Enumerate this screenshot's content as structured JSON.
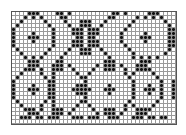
{
  "pattern": {
    "type": "chart-grid",
    "columns": 41,
    "rows": 28,
    "symbol_color": "#111111",
    "grid_color": "#9a9a9a",
    "rows_data": [
      "....XXX....XX.X..........XX.X.....XXX....",
      "...X.X.X....XX..........XX.....X.X.X.X...",
      "..X.....X....X...XXX...X......X.......X..",
      ".X.......X....X..XXX..X......X.........X.",
      "X.........X....XXX.XXX......X..........XX",
      "X....X....X....XXX.XXX.....X.....X.....XX",
      "X...XXX...X.....XX.XX......X....XXX....XX",
      "X....X....X....XXX.XXX.....X.....X.....XX",
      "X.........X....XXX.XXX......X..........XX",
      ".X.......X....X..XXX..X......X.........X.",
      "..X.....X....X...XXX...X......X.......X..",
      "...X.X.X....X...........X.....X.X.X.X....",
      "....XXX....XX..........XXX......XXX......",
      "....XXX...XXX.X......X.XXX.X...XXX.......",
      "...XXX.X..XXX..X....X..XXX..X..XXXX......",
      "..X....X..X.....X..X........X.X....X.....",
      ".X......X.X......XX..........X......X....",
      "X........XX.......X...........X......X..X",
      "X....X...XX.....XXX.....X.....X...X..X..X",
      "X...XXX..XX....XXXXX...XXX....X..XXX.X..X",
      "X....X...XX.....XXX.....X.....X...X..X..X",
      "X........XX.......X...........X......X..X",
      ".X......X.X......XX..........X......X....",
      "..X....X..X.....X..X........X.X....X.....",
      "...XXX.X..XXX..X....X..XXX..X..XXXX......",
      "....XXX...XXX.X......X.XXX.X...XXX.......",
      "..XXX.XX.XXX...XXX.XXX..XXX...XXX.XX.XX..",
      "........................................."
    ]
  }
}
